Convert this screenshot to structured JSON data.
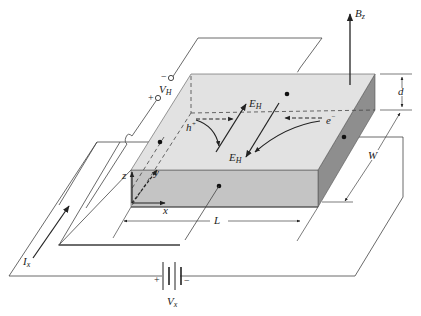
{
  "figure": {
    "colors": {
      "top_face": "#e2e2e2",
      "front_face": "#c4c4c4",
      "side_face": "#8e8e8e",
      "line": "#333333"
    }
  },
  "labels": {
    "magnetic_field": {
      "main": "B",
      "sub": "z"
    },
    "hall_voltage": {
      "main": "V",
      "sub": "H"
    },
    "hall_voltage_minus": "−",
    "hall_voltage_plus": "+",
    "hall_field_top": {
      "main": "E",
      "sub": "H"
    },
    "hall_field_bottom": {
      "main": "E",
      "sub": "H"
    },
    "hole": {
      "main": "h",
      "sup": "+"
    },
    "electron": {
      "main": "e",
      "sup": "−"
    },
    "axis_x": "x",
    "axis_y": "y",
    "axis_z": "z",
    "thickness": "d",
    "width": "W",
    "length": "L",
    "current": {
      "main": "I",
      "sub": "x"
    },
    "source_voltage": {
      "main": "V",
      "sub": "x"
    },
    "source_plus": "+",
    "source_minus": "−"
  }
}
